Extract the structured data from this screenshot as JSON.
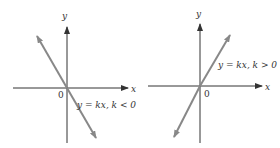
{
  "left_graph": {
    "y_axis_label": "y",
    "x_axis_label": "x",
    "origin_label": "0",
    "equation": "y = kx, k < 0"
  },
  "right_graph": {
    "y_axis_label": "y",
    "x_axis_label": "x",
    "origin_label": "0",
    "equation": "y = kx, k > 0"
  },
  "colors": {
    "axis": "#333333",
    "line": "#888888"
  }
}
